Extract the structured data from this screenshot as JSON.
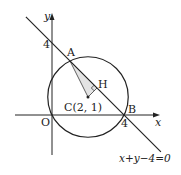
{
  "diagram": {
    "axes": {
      "x_label": "x",
      "y_label": "y",
      "origin_label": "O",
      "x_tick": 4,
      "y_tick": 4,
      "x_tick_label": "4",
      "y_tick_label": "4"
    },
    "circle": {
      "center": [
        2,
        1
      ],
      "radius_squared": 5
    },
    "line": {
      "equation_label": "x+y−4=0",
      "a": 1,
      "b": 1,
      "c": -4
    },
    "points": {
      "A": {
        "label": "A",
        "coords": [
          1,
          3
        ]
      },
      "B": {
        "label": "B",
        "coords": [
          4,
          0
        ]
      },
      "C": {
        "label": "C(2,  1)",
        "coords": [
          2,
          1
        ]
      },
      "H": {
        "label": "H",
        "coords": [
          2.5,
          1.5
        ]
      }
    },
    "colors": {
      "stroke": "#222222",
      "triangle_fill": "#e4e4e4"
    }
  }
}
